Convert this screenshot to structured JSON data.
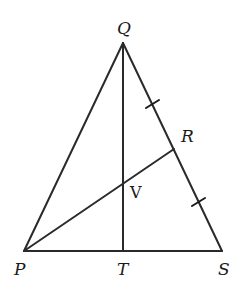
{
  "figure": {
    "type": "geometry-triangle",
    "points": {
      "Q": {
        "label": "Q",
        "x": 123,
        "y": 43
      },
      "P": {
        "label": "P",
        "x": 24,
        "y": 251
      },
      "S": {
        "label": "S",
        "x": 222,
        "y": 251
      },
      "T": {
        "label": "T",
        "x": 123,
        "y": 251
      },
      "R": {
        "label": "R",
        "x": 174,
        "y": 149
      },
      "V": {
        "label": "V",
        "x": 123,
        "y": 182
      }
    },
    "segments": [
      "PQ",
      "QS",
      "PS",
      "QT",
      "PR"
    ],
    "congruence_marks": {
      "segments": [
        "QR",
        "RS"
      ],
      "count_each": 1
    },
    "labels": {
      "Q": "Q",
      "P": "P",
      "S": "S",
      "T": "T",
      "R": "R",
      "V": "V"
    },
    "colors": {
      "line": "#2a2a2a",
      "text": "#1a1a1a",
      "background": "#ffffff"
    }
  }
}
